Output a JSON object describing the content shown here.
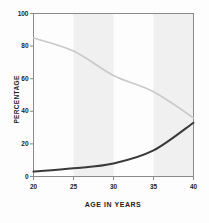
{
  "chart_data": {
    "type": "line",
    "title": "",
    "subtitle": "",
    "xlabel": "AGE IN YEARS",
    "ylabel": "PERCENTAGE",
    "x": [
      20,
      25,
      30,
      35,
      40
    ],
    "xlim": [
      20,
      40
    ],
    "ylim": [
      0,
      100
    ],
    "xticks": [
      20,
      25,
      30,
      35,
      40
    ],
    "yticks": [
      0,
      20,
      40,
      60,
      80,
      100
    ],
    "xtick_labels": [
      "20",
      "25",
      "30",
      "35",
      "40"
    ],
    "ytick_labels": [
      "0",
      "20",
      "40",
      "60",
      "80",
      "100"
    ],
    "grid": false,
    "legend": "none",
    "series": [
      {
        "name": "declining-curve",
        "color": "#c9c9c9",
        "values": [
          85,
          77,
          62,
          52,
          36
        ]
      },
      {
        "name": "rising-curve",
        "color": "#3a3a3a",
        "values": [
          3,
          5,
          8,
          16,
          33
        ]
      }
    ],
    "shaded_bands": [
      {
        "from": 25,
        "to": 30,
        "color": "#f0f0f0"
      },
      {
        "from": 35,
        "to": 40,
        "color": "#f0f0f0"
      }
    ],
    "annotations": []
  },
  "axis": {
    "line_color": "#8a8a8a",
    "text_color": "#1d1d1d"
  }
}
